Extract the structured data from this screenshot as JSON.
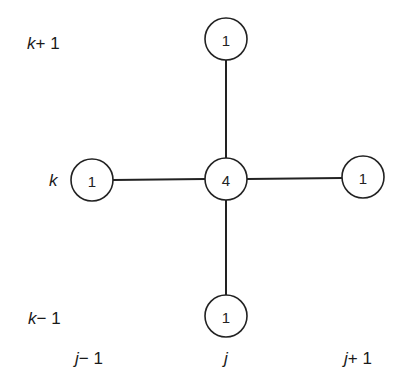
{
  "diagram": {
    "type": "five-point-stencil",
    "nodes": [
      {
        "id": "center",
        "value": "4",
        "x": 226,
        "y": 179
      },
      {
        "id": "top",
        "value": "1",
        "x": 226,
        "y": 39
      },
      {
        "id": "bottom",
        "value": "1",
        "x": 226,
        "y": 316
      },
      {
        "id": "left",
        "value": "1",
        "x": 92,
        "y": 180
      },
      {
        "id": "right",
        "value": "1",
        "x": 363,
        "y": 177
      }
    ],
    "row_labels": [
      {
        "var": "k",
        "suffix": "+ 1"
      },
      {
        "var": "k",
        "suffix": ""
      },
      {
        "var": "k",
        "suffix": "− 1"
      }
    ],
    "column_labels": [
      {
        "var": "j",
        "suffix": "− 1"
      },
      {
        "var": "j",
        "suffix": ""
      },
      {
        "var": "j",
        "suffix": "+ 1"
      }
    ]
  }
}
